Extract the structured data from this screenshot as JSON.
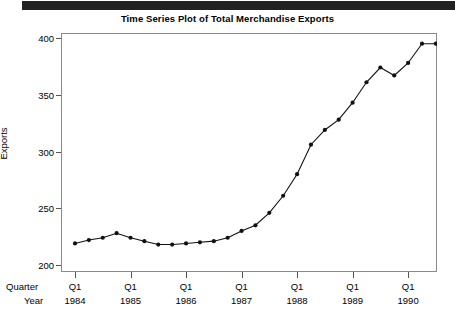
{
  "top_bar": {
    "color": "#222222"
  },
  "chart_data": {
    "type": "line",
    "title": "Time Series Plot of Total Merchandise Exports",
    "xlabel": "",
    "ylabel": "Exports",
    "ylim": [
      200,
      400
    ],
    "yticks": [
      200,
      250,
      300,
      350,
      400
    ],
    "grid": false,
    "legend": null,
    "marker": "filled-circle",
    "line_color": "#111111",
    "marker_color": "#111111",
    "axis_row_labels": {
      "quarter": "Quarter",
      "year": "Year"
    },
    "x_major_ticks": [
      {
        "quarter": "Q1",
        "year": "1984"
      },
      {
        "quarter": "Q1",
        "year": "1985"
      },
      {
        "quarter": "Q1",
        "year": "1986"
      },
      {
        "quarter": "Q1",
        "year": "1987"
      },
      {
        "quarter": "Q1",
        "year": "1988"
      },
      {
        "quarter": "Q1",
        "year": "1989"
      },
      {
        "quarter": "Q1",
        "year": "1990"
      }
    ],
    "x_index": [
      0,
      1,
      2,
      3,
      4,
      5,
      6,
      7,
      8,
      9,
      10,
      11,
      12,
      13,
      14,
      15,
      16,
      17,
      18,
      19,
      20,
      21,
      22,
      23,
      24,
      25,
      26
    ],
    "x_period_labels": [
      "Q1 1984",
      "Q2 1984",
      "Q3 1984",
      "Q4 1984",
      "Q1 1985",
      "Q2 1985",
      "Q3 1985",
      "Q4 1985",
      "Q1 1986",
      "Q2 1986",
      "Q3 1986",
      "Q4 1986",
      "Q1 1987",
      "Q2 1987",
      "Q3 1987",
      "Q4 1987",
      "Q1 1988",
      "Q2 1988",
      "Q3 1988",
      "Q4 1988",
      "Q1 1989",
      "Q2 1989",
      "Q3 1989",
      "Q4 1989",
      "Q1 1990",
      "Q2 1990",
      "Q3 1990"
    ],
    "values": [
      219,
      222,
      224,
      228,
      224,
      221,
      218,
      218,
      219,
      220,
      221,
      224,
      230,
      235,
      246,
      261,
      280,
      306,
      319,
      328,
      343,
      361,
      374,
      367,
      378,
      395,
      395
    ]
  }
}
